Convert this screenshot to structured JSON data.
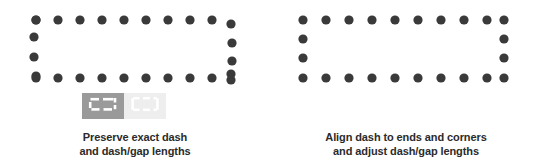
{
  "colors": {
    "background": "#ffffff",
    "dot": "#3a3a3a",
    "selected_bg": "#9a9a9a",
    "unselected_bg": "#eeeeee",
    "icon_stroke_on_selected": "#ffffff",
    "icon_stroke_on_unselected": "#ffffff",
    "caption_text": "#2b2b2b"
  },
  "panels": [
    {
      "id": "preserve-exact-dash",
      "caption_lines": [
        "Preserve exact dash",
        "and dash/gap lengths"
      ],
      "selected_option": "preserve-dash-length",
      "options": [
        {
          "id": "preserve-dash-length",
          "icon": "dashed-rect-unaligned-icon",
          "label": "Preserve exact dash and dash/gap lengths",
          "selected": true
        },
        {
          "id": "align-dash-to-corners",
          "icon": "dashed-rect-aligned-icon",
          "label": "Align dash to ends and corners and adjust dash/gap lengths",
          "selected": false
        }
      ],
      "diagram": {
        "type": "dotted-rectangle",
        "aligned_to_corners": false,
        "dot_radius": 4.6,
        "rect": {
          "x": 31,
          "y": 17,
          "width": 205,
          "height": 55
        },
        "top_dots": 9,
        "bottom_dots": 9,
        "left_dots": 4,
        "right_dots": 4,
        "corner_offset_note": "dashes overrun the corners; right edge dots are shifted"
      }
    },
    {
      "id": "align-dash-to-ends",
      "caption_lines": [
        "Align dash to ends and corners",
        "and adjust dash/gap lengths"
      ],
      "selected_option": "align-dash-to-corners",
      "options": [
        {
          "id": "preserve-dash-length",
          "icon": "dashed-rect-unaligned-icon",
          "label": "Preserve exact dash and dash/gap lengths",
          "selected": false
        },
        {
          "id": "align-dash-to-corners",
          "icon": "dashed-rect-aligned-icon",
          "label": "Align dash to ends and corners and adjust dash/gap lengths",
          "selected": true
        }
      ],
      "diagram": {
        "type": "dotted-rectangle",
        "aligned_to_corners": true,
        "dot_radius": 4.6,
        "rect": {
          "x": 31,
          "y": 17,
          "width": 205,
          "height": 55
        },
        "top_dots": 10,
        "bottom_dots": 10,
        "left_dots": 4,
        "right_dots": 4,
        "corner_offset_note": "dots land exactly on all four corners"
      }
    }
  ]
}
